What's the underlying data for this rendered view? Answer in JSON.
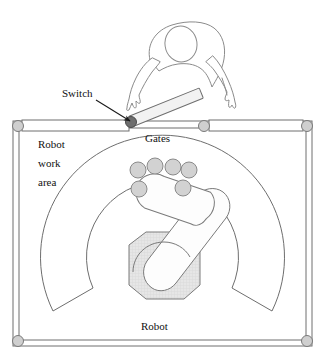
{
  "diagram": {
    "type": "schematic-top-view",
    "labels": {
      "switch": "Switch",
      "gates": "Gates",
      "robot_work_area_line1": "Robot",
      "robot_work_area_line2": "work",
      "robot_work_area_line3": "area",
      "robot": "Robot"
    },
    "colors": {
      "outline": "#555555",
      "line": "#6a6a6a",
      "fill_light": "#f2f2f2",
      "fill_disc": "#d2d2d2",
      "fill_base": "#e2e2e2",
      "pivot_dark": "#6e6e6e",
      "pivot_light": "#cfcfcf",
      "text": "#111111",
      "background": "#ffffff"
    },
    "elements": {
      "human_operator": {
        "name": "human-operator",
        "description": "outline of a person leaning over the cell from above, head and two arms reaching down"
      },
      "left_gate": {
        "name": "left-gate",
        "state": "closed",
        "pivot_end": "right",
        "pivot_color": "dark"
      },
      "open_gate": {
        "name": "open-gate",
        "state": "open",
        "angle_deg": -22,
        "pivot_end": "lower-left"
      },
      "right_gate": {
        "name": "right-gate",
        "state": "closed",
        "pivot_ends": "both"
      },
      "work_area": {
        "name": "robot-work-area",
        "shape": "annular-sector",
        "outer_radius": 122,
        "inner_radius": 68
      },
      "robot_base": {
        "name": "robot-base",
        "shape": "octagon"
      },
      "robot_arm": {
        "name": "robot-arm",
        "links": 2
      },
      "discs": {
        "name": "workpiece-discs",
        "count": 6,
        "positions": [
          {
            "cx": 138,
            "cy": 170,
            "r": 8
          },
          {
            "cx": 155,
            "cy": 166,
            "r": 8
          },
          {
            "cx": 173,
            "cy": 167,
            "r": 8
          },
          {
            "cx": 189,
            "cy": 170,
            "r": 8
          },
          {
            "cx": 139,
            "cy": 189,
            "r": 8
          },
          {
            "cx": 183,
            "cy": 188,
            "r": 8
          }
        ]
      },
      "corner_pivots": {
        "name": "corner-pivots",
        "count": 4,
        "positions": [
          {
            "cx": 18,
            "cy": 126
          },
          {
            "cx": 307,
            "cy": 126
          },
          {
            "cx": 18,
            "cy": 341
          },
          {
            "cx": 307,
            "cy": 341
          }
        ]
      },
      "switch_arrow": {
        "name": "switch-callout-arrow",
        "from": [
          96,
          100
        ],
        "to": [
          131,
          122
        ]
      }
    }
  }
}
